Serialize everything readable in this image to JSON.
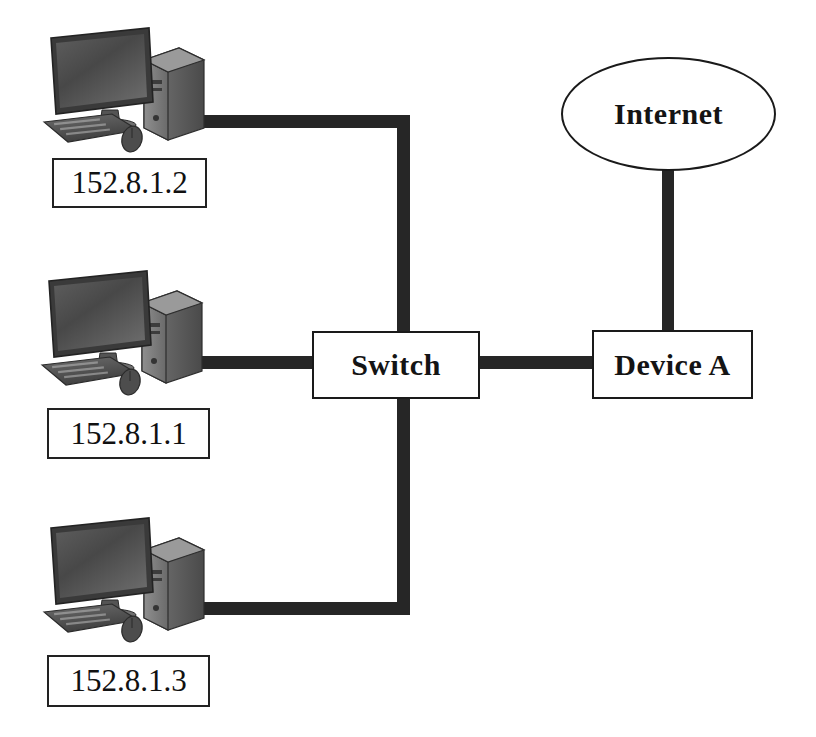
{
  "diagram": {
    "background_color": "#ffffff",
    "line_color": "#262626",
    "nodes": {
      "switch": {
        "label": "Switch"
      },
      "device_a": {
        "label": "Device A"
      },
      "internet": {
        "label": "Internet"
      }
    },
    "workstations": [
      {
        "icon": "desktop-computer-icon",
        "ip_label": "152.8.1.2"
      },
      {
        "icon": "desktop-computer-icon",
        "ip_label": "152.8.1.1"
      },
      {
        "icon": "desktop-computer-icon",
        "ip_label": "152.8.1.3"
      }
    ],
    "links": [
      {
        "from": "152.8.1.2",
        "to": "Switch",
        "style": "elbow"
      },
      {
        "from": "152.8.1.1",
        "to": "Switch",
        "style": "straight"
      },
      {
        "from": "152.8.1.3",
        "to": "Switch",
        "style": "elbow"
      },
      {
        "from": "Switch",
        "to": "Device A",
        "style": "straight"
      },
      {
        "from": "Device A",
        "to": "Internet",
        "style": "straight"
      }
    ]
  }
}
